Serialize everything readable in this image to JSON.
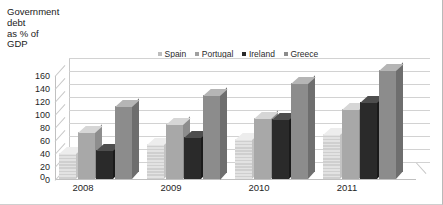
{
  "chart_data": {
    "type": "bar",
    "title": "Government\ndebt\nas % of\nGDP",
    "title_lines": [
      "Government",
      "debt",
      "as % of",
      "GDP"
    ],
    "xlabel": "",
    "ylabel": "Government debt as % of GDP",
    "categories": [
      "2008",
      "2009",
      "2010",
      "2011"
    ],
    "ylim": [
      0,
      160
    ],
    "yticks": [
      160,
      140,
      120,
      100,
      80,
      60,
      40,
      20,
      0
    ],
    "grid": true,
    "legend_position": "top-right",
    "three_d": true,
    "series": [
      {
        "name": "Spain",
        "color": "#d8d8d8",
        "values": [
          40,
          54,
          61,
          69
        ]
      },
      {
        "name": "Portugal",
        "color": "#a8a8a8",
        "values": [
          72,
          84,
          94,
          108
        ]
      },
      {
        "name": "Ireland",
        "color": "#2a2a2a",
        "values": [
          44,
          65,
          93,
          118
        ]
      },
      {
        "name": "Greece",
        "color": "#8c8c8c",
        "values": [
          113,
          130,
          148,
          167
        ]
      }
    ]
  },
  "legend": {
    "items": [
      {
        "label": "Spain",
        "color": "#bdbdbd"
      },
      {
        "label": "Portugal",
        "color": "#a0a0a0"
      },
      {
        "label": "Ireland",
        "color": "#2a2a2a"
      },
      {
        "label": "Greece",
        "color": "#8c8c8c"
      }
    ]
  },
  "axis": {
    "zero_label": "0"
  }
}
